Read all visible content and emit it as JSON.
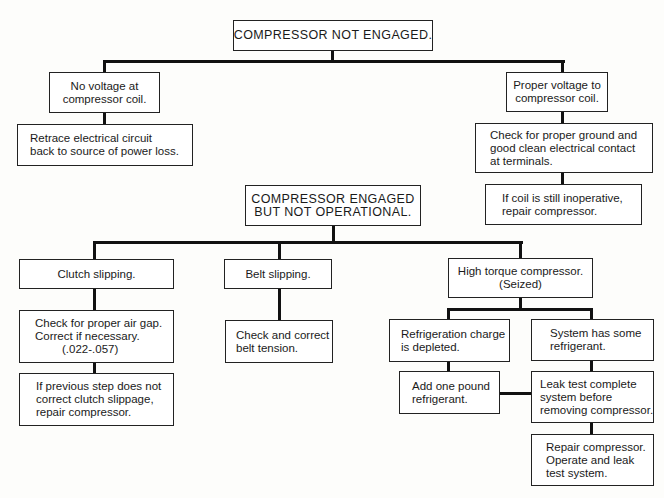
{
  "top_tree": {
    "root": "COMPRESSOR NOT ENGAGED.",
    "left_branch": {
      "condition": [
        "No voltage at",
        "compressor coil."
      ],
      "action": [
        "Retrace electrical circuit",
        "back to source of power loss."
      ]
    },
    "right_branch": {
      "condition": [
        "Proper voltage to",
        "compressor coil."
      ],
      "action": [
        "Check for proper ground and",
        "good clean electrical contact",
        "at terminals."
      ],
      "followup": [
        "If coil is still inoperative,",
        "repair compressor."
      ]
    }
  },
  "bottom_tree": {
    "root": [
      "COMPRESSOR ENGAGED",
      "BUT NOT OPERATIONAL."
    ],
    "clutch": {
      "condition": "Clutch slipping.",
      "action": [
        "Check for proper air gap.",
        "Correct if necessary.",
        "(.022-.057)"
      ],
      "followup": [
        "If previous step does not",
        "correct clutch slippage,",
        "repair compressor."
      ]
    },
    "belt": {
      "condition": "Belt slipping.",
      "action": [
        "Check and correct",
        "belt tension."
      ]
    },
    "seized": {
      "condition": [
        "High torque compressor.",
        "(Seized)"
      ],
      "depleted": {
        "condition": [
          "Refrigeration charge",
          "is depleted."
        ],
        "action": [
          "Add one pound",
          "refrigerant."
        ]
      },
      "some_refrigerant": {
        "condition": [
          "System has some",
          "refrigerant."
        ],
        "action": [
          "Leak test complete",
          "system before",
          "removing compressor."
        ],
        "followup": [
          "Repair compressor.",
          "Operate and leak",
          "test system."
        ]
      }
    }
  }
}
